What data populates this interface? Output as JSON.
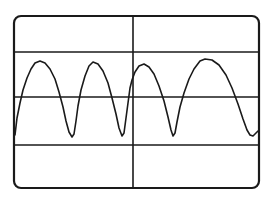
{
  "figure": {
    "colors": {
      "background": "#ffffff",
      "line": "#1a1a1a"
    }
  },
  "screen": {
    "frame": {
      "x": 14,
      "y": 16,
      "width": 245,
      "height": 172,
      "corner_radius": 7
    },
    "gridlines": {
      "vertical_x": [
        133
      ],
      "horizontal_y": [
        52,
        97,
        145
      ]
    }
  },
  "chart_data": {
    "type": "line",
    "title": "",
    "xlabel": "",
    "ylabel": "",
    "grid": true,
    "legend": null,
    "series": [
      {
        "name": "trace",
        "points": [
          [
            15,
            135
          ],
          [
            17,
            118
          ],
          [
            20,
            103
          ],
          [
            23,
            90
          ],
          [
            27,
            78
          ],
          [
            31,
            69
          ],
          [
            35,
            63
          ],
          [
            40,
            61
          ],
          [
            45,
            63
          ],
          [
            50,
            69
          ],
          [
            55,
            79
          ],
          [
            59,
            92
          ],
          [
            63,
            107
          ],
          [
            66,
            121
          ],
          [
            69,
            132
          ],
          [
            72,
            137
          ],
          [
            74,
            134
          ],
          [
            76,
            121
          ],
          [
            78,
            106
          ],
          [
            81,
            90
          ],
          [
            85,
            76
          ],
          [
            89,
            66
          ],
          [
            93,
            62
          ],
          [
            98,
            64
          ],
          [
            103,
            71
          ],
          [
            108,
            83
          ],
          [
            112,
            98
          ],
          [
            116,
            114
          ],
          [
            119,
            128
          ],
          [
            122,
            136
          ],
          [
            124,
            133
          ],
          [
            126,
            118
          ],
          [
            128,
            103
          ],
          [
            130,
            88
          ],
          [
            132,
            80
          ],
          [
            135,
            72
          ],
          [
            139,
            66
          ],
          [
            144,
            64
          ],
          [
            149,
            67
          ],
          [
            154,
            74
          ],
          [
            159,
            86
          ],
          [
            164,
            101
          ],
          [
            168,
            117
          ],
          [
            171,
            130
          ],
          [
            173,
            136
          ],
          [
            175,
            133
          ],
          [
            177,
            122
          ],
          [
            180,
            107
          ],
          [
            184,
            93
          ],
          [
            189,
            79
          ],
          [
            194,
            69
          ],
          [
            200,
            61
          ],
          [
            205,
            59
          ],
          [
            212,
            60
          ],
          [
            219,
            65
          ],
          [
            226,
            75
          ],
          [
            232,
            88
          ],
          [
            238,
            104
          ],
          [
            243,
            119
          ],
          [
            247,
            130
          ],
          [
            250,
            135
          ],
          [
            253,
            136
          ],
          [
            256,
            133
          ],
          [
            258,
            131
          ]
        ]
      }
    ],
    "xlim": [
      14,
      259
    ],
    "ylim": [
      16,
      188
    ]
  }
}
